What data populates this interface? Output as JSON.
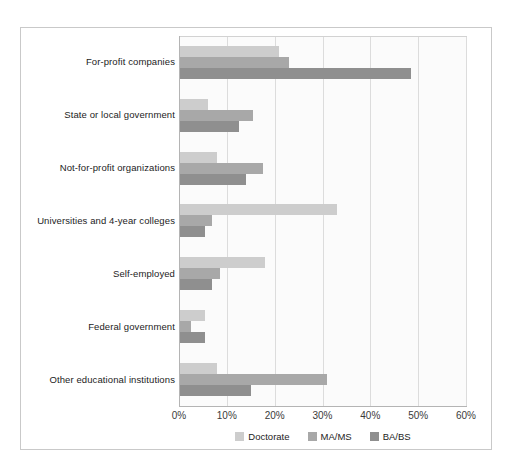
{
  "chart_data": {
    "type": "bar",
    "orientation": "horizontal",
    "title": "",
    "xlabel": "",
    "ylabel": "",
    "xlim": [
      0,
      60
    ],
    "xtick_labels": [
      "0%",
      "10%",
      "20%",
      "30%",
      "40%",
      "50%",
      "60%"
    ],
    "xtick_values": [
      0,
      10,
      20,
      30,
      40,
      50,
      60
    ],
    "grid": true,
    "legend_position": "bottom-center",
    "categories": [
      "For-profit companies",
      "State or local government",
      "Not-for-profit organizations",
      "Universities and 4-year colleges",
      "Self-employed",
      "Federal government",
      "Other educational institutions"
    ],
    "series": [
      {
        "name": "Doctorate",
        "color": "#cdcdcd",
        "values": [
          21,
          6,
          8,
          33,
          18,
          5.5,
          8
        ]
      },
      {
        "name": "MA/MS",
        "color": "#a8a8a8",
        "values": [
          23,
          15.5,
          17.5,
          7,
          8.5,
          2.5,
          31
        ]
      },
      {
        "name": "BA/BS",
        "color": "#8f8f8f",
        "values": [
          48.5,
          12.5,
          14,
          5.5,
          7,
          5.5,
          15
        ]
      }
    ]
  },
  "figure": {
    "background_color": "#ffffff",
    "plot_background_color": "#fbfbfb",
    "frame_color": "#c9c9c9",
    "gridline_color": "#dcdcdc",
    "axis_color": "#b4b4b4"
  }
}
